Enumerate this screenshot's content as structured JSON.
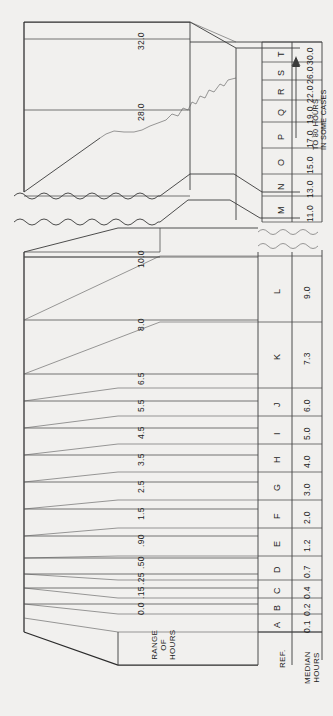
{
  "figure": {
    "orientation": "rotated-90",
    "background_color": "#f1f0ee",
    "line_color": "#3a3a3a"
  },
  "axis": {
    "range_title_line1": "RANGE",
    "range_title_line2": "OF",
    "range_title_line3": "HOURS",
    "ref_title": "REF.",
    "median_title_line1": "MEDIAN",
    "median_title_line2": "HOURS"
  },
  "note": {
    "line1": "TO 80 HOURS",
    "line2": "IN SOME CASES",
    "arrow": "arrow-up-icon"
  },
  "chart_data": {
    "type": "bar",
    "xlabel": "REF.",
    "ylabel": "RANGE OF HOURS",
    "grid": false,
    "legend": "none",
    "annotation": "TO 80 HOURS IN SOME CASES",
    "axis_break": "wavy break between 10.0 and 28.0",
    "tick_labels": [
      "0.0",
      ".15",
      ".25",
      ".50",
      ".90",
      "1.5",
      "2.5",
      "3.5",
      "4.5",
      "5.5",
      "6.5",
      "8.0",
      "10.0",
      "28.0",
      "32.0"
    ],
    "tick_values": [
      0.0,
      0.15,
      0.25,
      0.5,
      0.9,
      1.5,
      2.5,
      3.5,
      4.5,
      5.5,
      6.5,
      8.0,
      10.0,
      28.0,
      32.0
    ],
    "categories": [
      "A",
      "B",
      "C",
      "D",
      "E",
      "F",
      "G",
      "H",
      "I",
      "J",
      "K",
      "L",
      "M",
      "N",
      "O",
      "P",
      "Q",
      "R",
      "S",
      "T"
    ],
    "median_hours": [
      "0.1",
      "0.2",
      "0.4",
      "0.7",
      "1.2",
      "2.0",
      "3.0",
      "4.0",
      "5.0",
      "6.0",
      "7.3",
      "9.0",
      "11.0",
      "13.0",
      "15.0",
      "17.0",
      "19.0",
      "22.0",
      "26.0",
      "30.0"
    ],
    "median_values": [
      0.1,
      0.2,
      0.4,
      0.7,
      1.2,
      2.0,
      3.0,
      4.0,
      5.0,
      6.0,
      7.3,
      9.0,
      11.0,
      13.0,
      15.0,
      17.0,
      19.0,
      22.0,
      26.0,
      30.0
    ],
    "range_bands": [
      {
        "ref": "A",
        "low": 0.0,
        "high": 0.15
      },
      {
        "ref": "B",
        "low": 0.15,
        "high": 0.25
      },
      {
        "ref": "C",
        "low": 0.25,
        "high": 0.5
      },
      {
        "ref": "D",
        "low": 0.5,
        "high": 0.9
      },
      {
        "ref": "E",
        "low": 0.9,
        "high": 1.5
      },
      {
        "ref": "F",
        "low": 1.5,
        "high": 2.5
      },
      {
        "ref": "G",
        "low": 2.5,
        "high": 3.5
      },
      {
        "ref": "H",
        "low": 3.5,
        "high": 4.5
      },
      {
        "ref": "I",
        "low": 4.5,
        "high": 5.5
      },
      {
        "ref": "J",
        "low": 5.5,
        "high": 6.5
      },
      {
        "ref": "K",
        "low": 6.5,
        "high": 8.0
      },
      {
        "ref": "L",
        "low": 8.0,
        "high": 10.0
      },
      {
        "ref": "M",
        "low": 10.0,
        "high": 12.0
      },
      {
        "ref": "N",
        "low": 12.0,
        "high": 14.0
      },
      {
        "ref": "O",
        "low": 14.0,
        "high": 16.0
      },
      {
        "ref": "P",
        "low": 16.0,
        "high": 18.0
      },
      {
        "ref": "Q",
        "low": 18.0,
        "high": 20.5
      },
      {
        "ref": "R",
        "low": 20.5,
        "high": 24.0
      },
      {
        "ref": "S",
        "low": 24.0,
        "high": 28.0
      },
      {
        "ref": "T",
        "low": 28.0,
        "high": 32.0
      }
    ],
    "ylim": [
      0.0,
      32.0
    ]
  },
  "ticks": [
    {
      "label": "0.0",
      "y": 604
    },
    {
      "label": ".15",
      "y": 588
    },
    {
      "label": ".25",
      "y": 574
    },
    {
      "label": ".50",
      "y": 558
    },
    {
      "label": ".90",
      "y": 536
    },
    {
      "label": "1.5",
      "y": 509
    },
    {
      "label": "2.5",
      "y": 482
    },
    {
      "label": "3.5",
      "y": 455
    },
    {
      "label": "4.5",
      "y": 428
    },
    {
      "label": "5.5",
      "y": 401
    },
    {
      "label": "6.5",
      "y": 374
    },
    {
      "label": "8.0",
      "y": 320
    },
    {
      "label": "10.0",
      "y": 257
    },
    {
      "label": "28.0",
      "y": 110
    },
    {
      "label": "32.0",
      "y": 39
    }
  ],
  "table_lower": [
    {
      "ref": "A",
      "median": "0.1",
      "y0": 632,
      "y1": 614
    },
    {
      "ref": "B",
      "median": "0.2",
      "y0": 614,
      "y1": 598
    },
    {
      "ref": "C",
      "median": "0.4",
      "y0": 598,
      "y1": 580
    },
    {
      "ref": "D",
      "median": "0.7",
      "y0": 580,
      "y1": 556
    },
    {
      "ref": "E",
      "median": "1.2",
      "y0": 556,
      "y1": 528
    },
    {
      "ref": "F",
      "median": "2.0",
      "y0": 528,
      "y1": 500
    },
    {
      "ref": "G",
      "median": "3.0",
      "y0": 500,
      "y1": 472
    },
    {
      "ref": "H",
      "median": "4.0",
      "y0": 472,
      "y1": 444
    },
    {
      "ref": "I",
      "median": "5.0",
      "y0": 444,
      "y1": 416
    },
    {
      "ref": "J",
      "median": "6.0",
      "y0": 416,
      "y1": 388
    },
    {
      "ref": "K",
      "median": "7.3",
      "y0": 388,
      "y1": 322
    },
    {
      "ref": "L",
      "median": "9.0",
      "y0": 322,
      "y1": 256
    }
  ],
  "table_upper": [
    {
      "ref": "M",
      "median": "11.0",
      "y0": 222,
      "y1": 196
    },
    {
      "ref": "N",
      "median": "13.0",
      "y0": 196,
      "y1": 174
    },
    {
      "ref": "O",
      "median": "15.0",
      "y0": 174,
      "y1": 148
    },
    {
      "ref": "P",
      "median": "17.0",
      "y0": 148,
      "y1": 122
    },
    {
      "ref": "Q",
      "median": "19.0",
      "y0": 122,
      "y1": 100
    },
    {
      "ref": "R",
      "median": "22.0",
      "y0": 100,
      "y1": 80
    },
    {
      "ref": "S",
      "median": "26.0",
      "y0": 80,
      "y1": 62
    },
    {
      "ref": "T",
      "median": "30.0",
      "y0": 62,
      "y1": 42
    }
  ]
}
